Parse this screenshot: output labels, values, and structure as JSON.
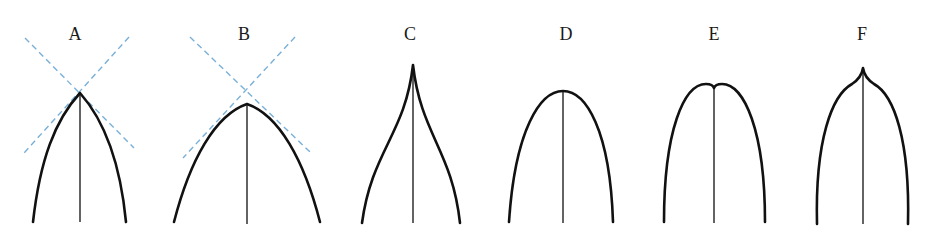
{
  "figure": {
    "colors": {
      "outline": "#111111",
      "midrib": "#222222",
      "guide": "#7ab0d8",
      "background": "#ffffff"
    },
    "panels": [
      {
        "label": "A",
        "shape": "acute apex with crossing dashed tangent guides",
        "label_pos": [
          75,
          40
        ],
        "apex": [
          80,
          93
        ],
        "path": "M33,222 C40,160 55,120 80,93 C104,120 120,160 126,222",
        "midrib": [
          80,
          93,
          80,
          222
        ],
        "guides": [
          [
            25,
            38,
            134,
            148
          ],
          [
            129,
            37,
            24,
            153
          ]
        ]
      },
      {
        "label": "B",
        "shape": "obtuse apex with crossing dashed tangent guides",
        "label_pos": [
          244,
          40
        ],
        "apex": [
          247,
          104
        ],
        "path": "M174,222 C190,160 215,115 247,104 C279,115 304,160 320,222",
        "midrib": [
          247,
          104,
          247,
          224
        ],
        "guides": [
          [
            190,
            37,
            310,
            152
          ],
          [
            295,
            37,
            183,
            158
          ]
        ]
      },
      {
        "label": "C",
        "shape": "acuminate apex",
        "label_pos": [
          410,
          40
        ],
        "apex": [
          413,
          65
        ],
        "path": "M362,223 C372,150 405,135 413,65 C421,135 452,150 460,223",
        "midrib": [
          413,
          65,
          413,
          223
        ],
        "guides": []
      },
      {
        "label": "D",
        "shape": "rounded apex",
        "label_pos": [
          566,
          40
        ],
        "apex": [
          563,
          91
        ],
        "path": "M509,222 C515,130 540,91 563,91 C586,91 610,130 613,222",
        "midrib": [
          563,
          91,
          563,
          223
        ],
        "guides": []
      },
      {
        "label": "E",
        "shape": "emarginate (notched) apex",
        "label_pos": [
          714,
          40
        ],
        "apex": [
          714,
          88
        ],
        "path": "M664,222 C664,130 684,84 706,84 C710,84 713,85 714,88 C715,85 718,84 722,84 C744,84 765,130 765,222",
        "midrib": [
          714,
          88,
          714,
          223
        ],
        "guides": []
      },
      {
        "label": "F",
        "shape": "mucronate (cuspidate) apex",
        "label_pos": [
          862,
          40
        ],
        "apex": [
          863,
          68
        ],
        "path": "M817,224 C815,140 832,95 852,84 C858,80 862,75 863,68 C864,75 868,80 874,84 C894,95 910,140 908,224",
        "midrib": [
          863,
          68,
          863,
          224
        ],
        "guides": []
      }
    ]
  }
}
